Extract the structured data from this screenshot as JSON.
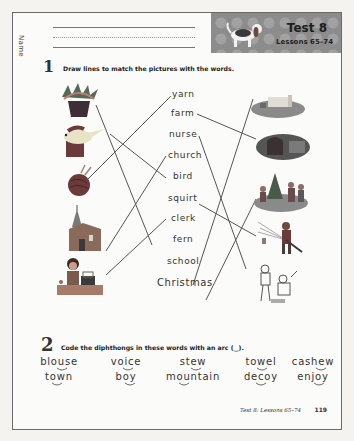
{
  "header": {
    "name_label": "Name",
    "test_title": "Test 8",
    "lessons": "Lessons 65–74"
  },
  "section1": {
    "number": "1",
    "instruction": "Draw lines to match the pictures with the words.",
    "left_pictures": [
      "fern-plant",
      "bird",
      "yarn-ball",
      "church",
      "clerk-at-counter"
    ],
    "words": [
      "yarn",
      "farm",
      "nurse",
      "church",
      "bird",
      "squirt",
      "clerk",
      "fern",
      "school",
      "Christmas"
    ],
    "right_pictures": [
      "farm",
      "nurse-hospital",
      "christmas-carolers",
      "squirt-hose",
      "school-children"
    ]
  },
  "section2": {
    "number": "2",
    "instruction": "Code the diphthongs in these words with an arc (‿).",
    "row1": [
      "blouse",
      "voice",
      "stew",
      "towel",
      "cashew"
    ],
    "row2": [
      "town",
      "boy",
      "mountain",
      "decoy",
      "enjoy"
    ]
  },
  "footer": {
    "text": "Test 8: Lessons 65–74",
    "page_number": "119"
  },
  "colors": {
    "line": "#555555",
    "header_bg": "#8c8c8c",
    "border": "#6a6a6a"
  }
}
